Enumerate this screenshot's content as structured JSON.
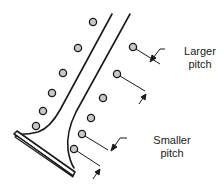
{
  "diagram": {
    "labels": {
      "larger_pitch": [
        "Larger",
        "pitch"
      ],
      "smaller_pitch": [
        "Smaller",
        "pitch"
      ]
    },
    "colors": {
      "stroke": "#1a1a1a",
      "dot_fill": "#c8c8c8",
      "background": "#ffffff"
    },
    "left_dots": [
      {
        "cx": 93,
        "cy": 22
      },
      {
        "cx": 78,
        "cy": 48
      },
      {
        "cx": 63,
        "cy": 73
      },
      {
        "cx": 52,
        "cy": 93
      },
      {
        "cx": 43,
        "cy": 111
      },
      {
        "cx": 36,
        "cy": 126
      }
    ],
    "right_dots": [
      {
        "cx": 133,
        "cy": 47
      },
      {
        "cx": 117,
        "cy": 74
      },
      {
        "cx": 103,
        "cy": 98
      },
      {
        "cx": 91,
        "cy": 118
      },
      {
        "cx": 82,
        "cy": 134
      },
      {
        "cx": 74,
        "cy": 149
      }
    ]
  }
}
